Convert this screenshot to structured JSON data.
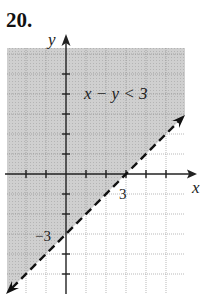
{
  "problem": {
    "number": "20."
  },
  "graph": {
    "inequality_label": "x − y < 3",
    "x_axis_label": "x",
    "y_axis_label": "y",
    "x_intercept_label": "3",
    "y_intercept_label": "−3",
    "boundary_line": "y = x − 3",
    "boundary_style": "dashed",
    "shaded_side": "above (upper-left)",
    "grid_unit": 1,
    "x_range": [
      -3,
      5
    ],
    "y_range": [
      -6,
      6
    ],
    "colors": {
      "shade": "#c9c9c9",
      "grid": "#8a8a8a",
      "axis": "#222222",
      "line": "#111111"
    }
  }
}
